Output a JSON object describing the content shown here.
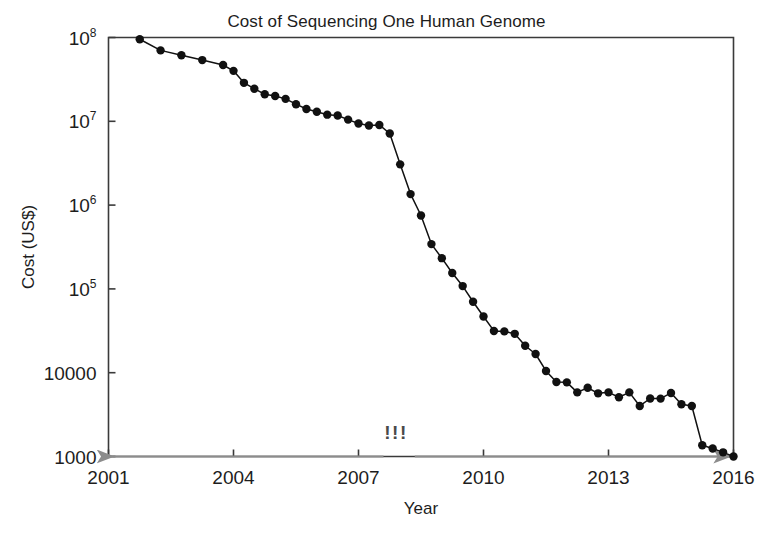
{
  "chart_data": {
    "type": "line",
    "title": "Cost of Sequencing One Human Genome",
    "xlabel": "Year",
    "ylabel": "Cost (US$)",
    "yscale": "log",
    "xlim": [
      2001,
      2016
    ],
    "ylim": [
      1000,
      100000000
    ],
    "grid": false,
    "legend": "none",
    "marker": "filled-circle",
    "line_color": "#111111",
    "marker_color": "#111111",
    "xticks": [
      2001,
      2004,
      2007,
      2010,
      2013,
      2016
    ],
    "xtick_labels": [
      "2001",
      "2004",
      "2007",
      "2010",
      "2013",
      "2016"
    ],
    "yticks": [
      1000,
      10000,
      100000,
      1000000,
      10000000,
      100000000
    ],
    "ytick_labels": [
      "1000",
      "10000",
      "10⁵",
      "10⁶",
      "10⁷",
      "10⁸"
    ],
    "ytick_labels_rich": [
      {
        "base": "1000",
        "exp": ""
      },
      {
        "base": "10000",
        "exp": ""
      },
      {
        "base": "10",
        "exp": "5"
      },
      {
        "base": "10",
        "exp": "6"
      },
      {
        "base": "10",
        "exp": "7"
      },
      {
        "base": "10",
        "exp": "8"
      }
    ],
    "series": [
      {
        "name": "Cost per genome",
        "x": [
          2001.75,
          2002.25,
          2002.75,
          2003.25,
          2003.75,
          2004.0,
          2004.25,
          2004.5,
          2004.75,
          2005.0,
          2005.25,
          2005.5,
          2005.75,
          2006.0,
          2006.25,
          2006.5,
          2006.75,
          2007.0,
          2007.25,
          2007.5,
          2007.75,
          2008.0,
          2008.25,
          2008.5,
          2008.75,
          2009.0,
          2009.25,
          2009.5,
          2009.75,
          2010.0,
          2010.25,
          2010.5,
          2010.75,
          2011.0,
          2011.25,
          2011.5,
          2011.75,
          2012.0,
          2012.25,
          2012.5,
          2012.75,
          2013.0,
          2013.25,
          2013.5,
          2013.75,
          2014.0,
          2014.25,
          2014.5,
          2014.75,
          2015.0,
          2015.25,
          2015.5,
          2015.75,
          2016.0
        ],
        "y": [
          95263072,
          70175437,
          61448422,
          53751684,
          47000000,
          40000000,
          28780376,
          24500000,
          21000000,
          20000000,
          18519312,
          16000000,
          14000000,
          13000000,
          12000000,
          11732535,
          10474556,
          9408739,
          8927342,
          9045000,
          7147571,
          3063820,
          1352982,
          752080,
          342502,
          232735,
          154714,
          108065,
          70333,
          46774,
          31512,
          31125,
          29092,
          20963,
          16712,
          10497,
          7743,
          7666,
          5826,
          6618,
          5671,
          5826,
          5096,
          5826,
          4008,
          4920,
          4905,
          5731,
          4211,
          4008,
          1363,
          1245,
          1121,
          1000
        ],
        "annotations": [
          {
            "text": "!!!",
            "x": 2007.9,
            "y": 1600,
            "color": "#4a4a4a"
          },
          {
            "type": "arrow",
            "name": "left-arrow",
            "x_from": 2007.6,
            "x_to": 2001.1,
            "y": 1000,
            "color": "#8c8c8c"
          },
          {
            "type": "arrow",
            "name": "right-arrow",
            "x_from": 2008.35,
            "x_to": 2015.9,
            "y": 1000,
            "color": "#8c8c8c"
          }
        ]
      }
    ]
  },
  "figure": {
    "background": "#ffffff",
    "axis_color": "#3a3a3a"
  }
}
